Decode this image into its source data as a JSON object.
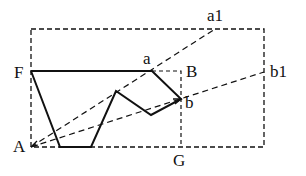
{
  "diagram": {
    "type": "geometric-construction",
    "stroke_color": "#111111",
    "background": "#ffffff",
    "points": {
      "F": {
        "label": "F",
        "x": 31,
        "y": 71
      },
      "A": {
        "label": "A",
        "x": 31,
        "y": 147
      },
      "a": {
        "label": "a",
        "x": 152,
        "y": 71
      },
      "B": {
        "label": "B",
        "x": 181,
        "y": 71
      },
      "b": {
        "label": "b",
        "x": 181,
        "y": 99
      },
      "G": {
        "label": "G",
        "x": 181,
        "y": 147
      },
      "a1": {
        "label": "a1",
        "x": 215,
        "y": 29
      },
      "b1": {
        "label": "b1",
        "x": 264,
        "y": 72
      }
    },
    "solid_polygon": [
      [
        31,
        71
      ],
      [
        152,
        71
      ],
      [
        181,
        99
      ],
      [
        151,
        115
      ],
      [
        116,
        91
      ],
      [
        91,
        147
      ],
      [
        60,
        147
      ],
      [
        31,
        71
      ]
    ],
    "dashed_outer_rect": {
      "x1": 31,
      "y1": 29,
      "x2": 264,
      "y2": 147
    },
    "dashed_inner": [
      [
        152,
        71
      ],
      [
        181,
        71
      ],
      [
        181,
        147
      ]
    ],
    "dashed_rays": [
      {
        "from": "A",
        "to": "a1"
      },
      {
        "from": "A",
        "to": "b1"
      }
    ],
    "labels": {
      "F": "F",
      "A": "A",
      "a": "a",
      "B": "B",
      "b": "b",
      "G": "G",
      "a1": "a1",
      "b1": "b1"
    }
  }
}
